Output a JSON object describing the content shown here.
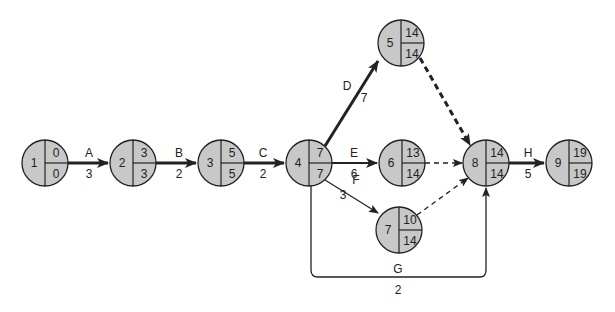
{
  "colors": {
    "node_fill": "#c8c8c8",
    "stroke": "#222222",
    "background": "#ffffff"
  },
  "nodes": [
    {
      "id": "1",
      "es": "0",
      "ls": "0",
      "x": 45,
      "y": 163
    },
    {
      "id": "2",
      "es": "3",
      "ls": "3",
      "x": 133,
      "y": 163
    },
    {
      "id": "3",
      "es": "5",
      "ls": "5",
      "x": 221,
      "y": 163
    },
    {
      "id": "4",
      "es": "7",
      "ls": "7",
      "x": 309,
      "y": 163
    },
    {
      "id": "5",
      "es": "14",
      "ls": "14",
      "x": 401,
      "y": 43
    },
    {
      "id": "6",
      "es": "13",
      "ls": "14",
      "x": 402,
      "y": 163
    },
    {
      "id": "7",
      "es": "10",
      "ls": "14",
      "x": 399,
      "y": 230
    },
    {
      "id": "8",
      "es": "14",
      "ls": "14",
      "x": 486,
      "y": 163
    },
    {
      "id": "9",
      "es": "19",
      "ls": "19",
      "x": 569,
      "y": 163
    }
  ],
  "activities": [
    {
      "name": "A",
      "duration": "3",
      "from": "1",
      "to": "2",
      "critical": true
    },
    {
      "name": "B",
      "duration": "2",
      "from": "2",
      "to": "3",
      "critical": true
    },
    {
      "name": "C",
      "duration": "2",
      "from": "3",
      "to": "4",
      "critical": true
    },
    {
      "name": "D",
      "duration": "7",
      "from": "4",
      "to": "5",
      "critical": true
    },
    {
      "name": "E",
      "duration": "6",
      "from": "4",
      "to": "6",
      "critical": false
    },
    {
      "name": "F",
      "duration": "3",
      "from": "4",
      "to": "7",
      "critical": false
    },
    {
      "name": "G",
      "duration": "2",
      "from": "4",
      "to": "8",
      "critical": false
    },
    {
      "name": "H",
      "duration": "5",
      "from": "8",
      "to": "9",
      "critical": true
    }
  ],
  "dummies": [
    {
      "from": "5",
      "to": "8",
      "critical": true
    },
    {
      "from": "6",
      "to": "8",
      "critical": false
    },
    {
      "from": "7",
      "to": "8",
      "critical": false
    }
  ]
}
